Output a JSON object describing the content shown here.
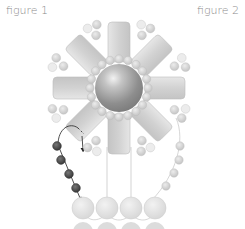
{
  "labels": {
    "figure1": "figure 1",
    "figure2": "figure 2"
  },
  "diagram": {
    "center": {
      "type": "large round pearl",
      "color": "#9a9a9a"
    },
    "petals": {
      "count": 8,
      "type": "rectangular bugle/tile beads",
      "color": "#d4d4d4"
    },
    "center_ring_beads": {
      "count": 20,
      "color": "#cfcfcf"
    },
    "outer_cluster_beads": {
      "clusters": 8,
      "beads_per_cluster": 3,
      "color": "#cdcdcd"
    },
    "thread_path_beads": {
      "count": 4,
      "color": "#4a4a4a",
      "label": "figure 1 thread path"
    },
    "right_strand_beads": {
      "count": 5,
      "color": "#d0d0d0"
    },
    "bottom_row_large_beads": {
      "count": 4,
      "color": "#e2e2e2"
    },
    "bottom_row_partial_beads": {
      "count": 4,
      "color": "#dadada"
    },
    "arrow": {
      "direction": "down",
      "style": "curved thread with arrowhead"
    }
  }
}
